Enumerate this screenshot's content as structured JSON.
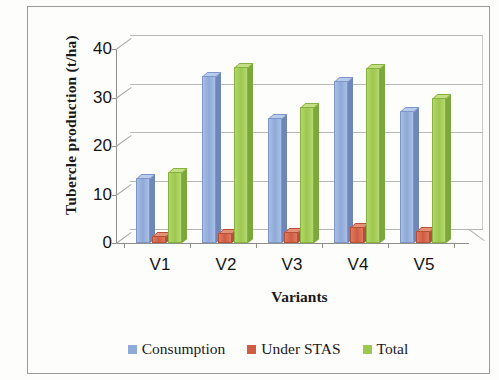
{
  "chart_data": {
    "type": "bar",
    "title": "",
    "subtitle": "",
    "xlabel": "Variants",
    "ylabel": "Tubercle production  (t/ha)",
    "categories": [
      "V1",
      "V2",
      "V3",
      "V4",
      "V5"
    ],
    "series": [
      {
        "name": "Consumption",
        "color": "#8fa9d8",
        "values": [
          13.3,
          34.5,
          25.8,
          33.5,
          27.3
        ]
      },
      {
        "name": "Under STAS",
        "color": "#d05c42",
        "values": [
          1.5,
          2.0,
          2.2,
          3.2,
          2.5
        ]
      },
      {
        "name": "Total",
        "color": "#9cc84f",
        "values": [
          14.7,
          36.2,
          28.0,
          36.0,
          29.8
        ]
      }
    ],
    "ylim": [
      0,
      40
    ],
    "yticks": [
      0,
      10,
      20,
      30,
      40
    ],
    "ytick_labels": [
      "0",
      "10",
      "20",
      "30",
      "40"
    ],
    "grid": true,
    "legend_position": "bottom",
    "style": "3d-clustered-column"
  },
  "axes": {
    "y_title": "Tubercle production  (t/ha)",
    "x_title": "Variants",
    "y_labels": [
      "40",
      "30",
      "20",
      "10",
      "0"
    ],
    "x_labels": [
      "V1",
      "V2",
      "V3",
      "V4",
      "V5"
    ]
  },
  "legend": {
    "items": [
      {
        "label": "Consumption",
        "color": "#8fa9d8"
      },
      {
        "label": "Under STAS",
        "color": "#d05c42"
      },
      {
        "label": "Total",
        "color": "#9cc84f"
      }
    ]
  }
}
